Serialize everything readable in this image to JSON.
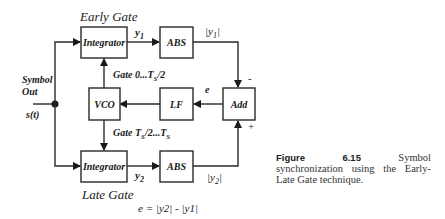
{
  "diagram": {
    "title_top": "Early Gate",
    "title_bottom": "Late Gate",
    "input": {
      "label_line1": "Symbol",
      "label_line2": "Out",
      "signal": "s(t)"
    },
    "blocks": {
      "integrator_top": "Integrator",
      "abs_top": "ABS",
      "add": "Add",
      "lf": "LF",
      "vco": "VCO",
      "integrator_bottom": "Integrator",
      "abs_bottom": "ABS"
    },
    "signals": {
      "y1": "y",
      "y1_sub": "1",
      "abs_y1": "|y",
      "abs_y1_sub": "1",
      "abs_y1_close": "|",
      "y2": "y",
      "y2_sub": "2",
      "abs_y2": "|y",
      "abs_y2_sub": "2",
      "abs_y2_close": "|",
      "e": "e",
      "minus": "-",
      "plus": "+"
    },
    "gates": {
      "early": "Gate 0...T",
      "early_sub": "S",
      "early_tail": "/2",
      "late": "Gate T",
      "late_sub": "S",
      "late_mid": "/2...T",
      "late_sub2": "S"
    },
    "equation": "e = |y2| - |y1|"
  },
  "caption": {
    "figure_label": "Figure 6.15",
    "text": "Symbol synchronization using the Early-Late Gate technique."
  }
}
